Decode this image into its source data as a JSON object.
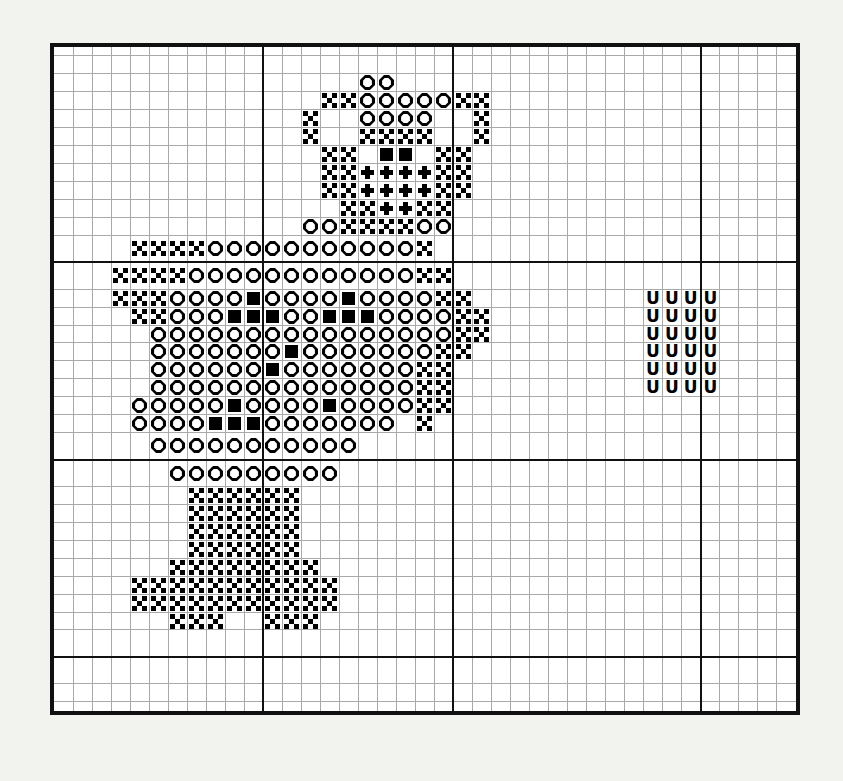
{
  "chart": {
    "type": "cross-stitch-grid",
    "columns": 39,
    "rows": 35,
    "cell_px": 19,
    "grid_line_color": "#a9a9a9",
    "heavy_line_color": "#111111",
    "border_color": "#111111",
    "background_color": "#ffffff",
    "page_background_color": "#f2f2ef",
    "heavy_line_columns": [
      11,
      21,
      34
    ],
    "heavy_line_rows": [
      12,
      22,
      32
    ],
    "symbol_legend": [
      {
        "key": "x",
        "name": "cross-symbol",
        "glyph": "X",
        "color": "#000000"
      },
      {
        "key": "d",
        "name": "dot-symbol",
        "glyph": "•",
        "color": "#000000"
      },
      {
        "key": "o",
        "name": "octagon-symbol",
        "glyph": "O",
        "color": "#000000"
      },
      {
        "key": "s",
        "name": "filled-square-symbol",
        "glyph": "■",
        "color": "#000000"
      },
      {
        "key": "u",
        "name": "letter-u-symbol",
        "glyph": "U",
        "color": "#000000"
      }
    ],
    "cells": [
      ".......................................",
      ".......................................",
      "..............xx.......................",
      "............xxoooo.xx..................",
      "...........x..xxxx..x..................",
      "............xx.xx.xx...................",
      "............xxddddxx...................",
      "............xxddddxx...................",
      ".............xxddxx....................",
      "......................................."
    ],
    "grid_rows": [
      "_______________________________________",
      "_______________________________________",
      "________________oo_____________________",
      "______________xxoooooxx________________",
      "_____________x__oooo__x________________",
      "_____________x__xxxx__x________________",
      "______________xx_ss_xx_________________",
      "______________xxddddxx_________________",
      "______________xxddddxx_________________",
      "_______________xxddxx__________________",
      "_____________ooxxxxoo__________________",
      "____xxxxooooooooooox___________________",
      "___xxxxooooooooooooxx__________________",
      "___xxxoooosoooosooooxx_________uuuu____",
      "____xxooosssoosssooooxx________uuuu____",
      "_____ooooooooooooooooxx________uuuu____",
      "_____ooooooosoooooooxx_________uuuu____",
      "_____oooooosoooooooxx__________uuuu____",
      "_____ooooooooooooooxx__________uuuu____",
      "____ooooosoooosooooxx__________________",
      "____oooosssooooooo_x___________________",
      "_____ooooooooooo_______________________",
      "______ooooooooo________________________",
      "_______xxxxxx__________________________",
      "_______xxxxxx__________________________",
      "_______xxxxxx__________________________",
      "_______xxxxxx__________________________",
      "______xxxxxxxx_________________________",
      "____xxxxxxxxxxx________________________",
      "____xxxxxxxxxxx________________________",
      "______xxx__xxx_________________________",
      "_______________________________________",
      "_______________________________________",
      "_______________________________________",
      "_______________________________________"
    ]
  }
}
